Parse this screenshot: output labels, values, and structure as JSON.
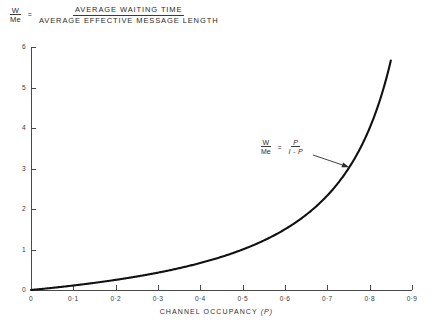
{
  "header": {
    "ratio_numerator": "W",
    "ratio_denominator": "Me",
    "equals": "=",
    "definition_numerator": "AVERAGE WAITING TIME",
    "definition_denominator": "AVERAGE EFFECTIVE MESSAGE LENGTH"
  },
  "annotation": {
    "ratio_numerator": "W",
    "ratio_denominator": "Me",
    "equals": "=",
    "formula_numerator": "P",
    "formula_denominator": "I - P"
  },
  "axes": {
    "x_caption_text": "CHANNEL OCCUPANCY",
    "x_caption_symbol": "(P)"
  },
  "chart_data": {
    "type": "line",
    "title": "",
    "xlabel": "CHANNEL OCCUPANCY (P)",
    "ylabel": "W / Me",
    "xlim": [
      0,
      0.9
    ],
    "ylim": [
      0,
      6
    ],
    "grid": false,
    "legend": null,
    "equation": "W/Me = P/(1-P)",
    "x_ticks": [
      0,
      0.1,
      0.2,
      0.3,
      0.4,
      0.5,
      0.6,
      0.7,
      0.8,
      0.9
    ],
    "x_ticklabels": [
      "0",
      "0·1",
      "0·2",
      "0·3",
      "0·4",
      "0·5",
      "0·6",
      "0·7",
      "0·8",
      "0·9"
    ],
    "y_ticks": [
      0,
      1,
      2,
      3,
      4,
      5,
      6
    ],
    "y_ticklabels": [
      "0",
      "1",
      "2",
      "3",
      "4",
      "5",
      "6"
    ],
    "series": [
      {
        "name": "W/Me = P/(1-P)",
        "color": "#111111",
        "x_start": 0,
        "x_end": 0.85,
        "x": [
          0,
          0.05,
          0.1,
          0.15,
          0.2,
          0.25,
          0.3,
          0.35,
          0.4,
          0.45,
          0.5,
          0.55,
          0.6,
          0.65,
          0.7,
          0.75,
          0.8,
          0.85
        ],
        "values": [
          0,
          0.053,
          0.111,
          0.176,
          0.25,
          0.333,
          0.429,
          0.538,
          0.667,
          0.818,
          1.0,
          1.222,
          1.5,
          1.857,
          2.333,
          3.0,
          4.0,
          5.667
        ]
      }
    ],
    "annotations": [
      {
        "text": "W/Me = P/(1-P)",
        "points_to_x": 0.752,
        "points_to_y": 3.03
      }
    ]
  }
}
